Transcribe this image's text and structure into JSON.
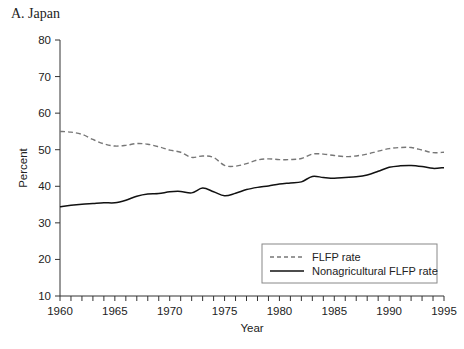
{
  "chart_data": {
    "type": "line",
    "title": "A. Japan",
    "xlabel": "Year",
    "ylabel": "Percent",
    "xlim": [
      1960,
      1995
    ],
    "ylim": [
      10,
      80
    ],
    "x_ticks": [
      1960,
      1965,
      1970,
      1975,
      1980,
      1985,
      1990,
      1995
    ],
    "x_minor_step": 1,
    "y_ticks": [
      10,
      20,
      30,
      40,
      50,
      60,
      70,
      80
    ],
    "grid": false,
    "legend_position": "bottom-right",
    "x": [
      1960,
      1961,
      1962,
      1963,
      1964,
      1965,
      1966,
      1967,
      1968,
      1969,
      1970,
      1971,
      1972,
      1973,
      1974,
      1975,
      1976,
      1977,
      1978,
      1979,
      1980,
      1981,
      1982,
      1983,
      1984,
      1985,
      1986,
      1987,
      1988,
      1989,
      1990,
      1991,
      1992,
      1993,
      1994,
      1995
    ],
    "series": [
      {
        "name": "FLFP rate",
        "style": "dashed",
        "color": "#777777",
        "values": [
          55.0,
          54.8,
          54.2,
          52.8,
          51.6,
          51.0,
          51.2,
          51.7,
          51.5,
          50.8,
          49.9,
          49.3,
          47.9,
          48.3,
          47.9,
          45.7,
          45.5,
          46.2,
          47.2,
          47.5,
          47.3,
          47.3,
          47.6,
          48.8,
          48.8,
          48.4,
          48.1,
          48.3,
          48.8,
          49.6,
          50.3,
          50.6,
          50.6,
          49.9,
          49.2,
          49.3
        ]
      },
      {
        "name": "Nonagricultural FLFP rate",
        "style": "solid",
        "color": "#111111",
        "values": [
          34.4,
          34.8,
          35.1,
          35.3,
          35.5,
          35.5,
          36.2,
          37.3,
          37.9,
          38.0,
          38.5,
          38.6,
          38.2,
          39.5,
          38.5,
          37.4,
          38.1,
          39.1,
          39.7,
          40.1,
          40.6,
          40.9,
          41.2,
          42.7,
          42.4,
          42.2,
          42.4,
          42.6,
          43.1,
          44.1,
          45.2,
          45.6,
          45.7,
          45.4,
          44.9,
          45.1
        ]
      }
    ]
  }
}
